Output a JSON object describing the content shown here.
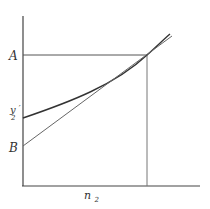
{
  "diagram": {
    "labels": {
      "A": "A",
      "y2prime_main": "y",
      "y2prime_prime": "′",
      "y2prime_sub": "2",
      "B": "B",
      "n2_main": "n",
      "n2_sub": "2"
    },
    "elements": [
      "y-axis",
      "x-axis",
      "horizontal line at A to intersection",
      "vertical line from intersection to n2 on x-axis",
      "curve starting at y2' rising to intersection and beyond",
      "straight tangent line from B through intersection and beyond"
    ],
    "colors": {
      "ink": "#333333",
      "line": "#444444",
      "thin": "#777777"
    }
  }
}
